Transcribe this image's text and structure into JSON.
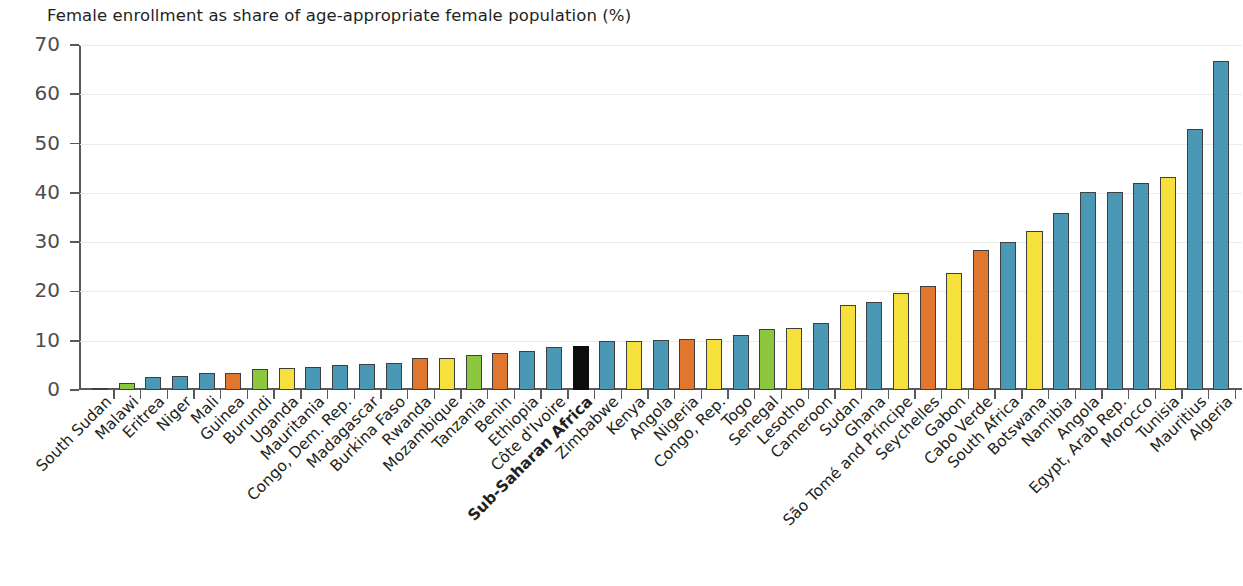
{
  "chart_data": {
    "type": "bar",
    "title": "Female enrollment as share of age-appropriate female population (%)",
    "xlabel": "",
    "ylabel": "",
    "ylim": [
      0,
      70
    ],
    "ytick_values": [
      0,
      10,
      20,
      30,
      40,
      50,
      60,
      70
    ],
    "ytick_labels": [
      "0",
      "10",
      "20",
      "30",
      "40",
      "50",
      "60",
      "70"
    ],
    "grid": true,
    "legend": "none",
    "colors": {
      "teal": "#4b98b5",
      "yellow": "#f6e13c",
      "orange": "#e1762e",
      "green": "#8dc63f",
      "black": "#0d0d0d",
      "grey": "#58595b"
    },
    "categories": [
      "South Sudan",
      "Malawi",
      "Eritrea",
      "Niger",
      "Mali",
      "Guinea",
      "Burundi",
      "Uganda",
      "Mauritania",
      "Congo, Dem. Rep.",
      "Madagascar",
      "Burkina Faso",
      "Rwanda",
      "Mozambique",
      "Tanzania",
      "Benin",
      "Ethiopia",
      "Côte d'Ivoire",
      "Sub-Saharan Africa",
      "Zimbabwe",
      "Kenya",
      "Angola",
      "Nigeria",
      "Congo, Rep.",
      "Togo",
      "Senegal",
      "Lesotho",
      "Cameroon",
      "Sudan",
      "Ghana",
      "São Tomé and Príncipe",
      "Seychelles",
      "Gabon",
      "Cabo Verde",
      "South Africa",
      "Botswana",
      "Namibia",
      "Angola",
      "Egypt, Arab Rep.",
      "Morocco",
      "Tunisia",
      "Mauritius",
      "Algeria"
    ],
    "values": [
      0.3,
      1.5,
      2.7,
      2.9,
      3.4,
      3.4,
      4.2,
      4.4,
      4.6,
      5.1,
      5.3,
      5.5,
      6.4,
      6.5,
      7.2,
      7.6,
      7.9,
      8.7,
      8.9,
      9.9,
      10.0,
      10.1,
      10.3,
      10.3,
      11.1,
      12.3,
      12.5,
      13.5,
      17.2,
      17.9,
      19.6,
      21.2,
      23.7,
      28.5,
      30.0,
      32.3,
      35.9,
      40.1,
      40.2,
      42.0,
      43.3,
      52.9,
      66.8
    ],
    "bar_colors": [
      "grey",
      "green",
      "teal",
      "teal",
      "teal",
      "orange",
      "green",
      "yellow",
      "teal",
      "teal",
      "teal",
      "teal",
      "orange",
      "yellow",
      "green",
      "orange",
      "teal",
      "teal",
      "black",
      "teal",
      "yellow",
      "teal",
      "orange",
      "yellow",
      "teal",
      "green",
      "yellow",
      "teal",
      "yellow",
      "teal",
      "yellow",
      "orange",
      "yellow",
      "orange",
      "teal",
      "yellow",
      "teal",
      "teal",
      "teal",
      "teal",
      "yellow",
      "teal",
      "teal"
    ],
    "highlight_category": "Sub-Saharan Africa"
  }
}
